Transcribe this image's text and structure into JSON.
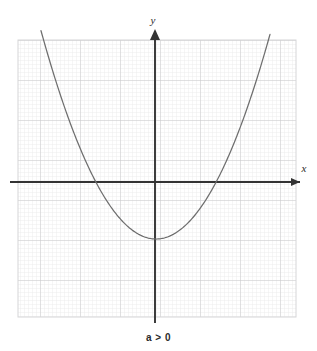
{
  "figure": {
    "caption": "a > 0",
    "background_color": "#ffffff"
  },
  "axes": {
    "x_label": "x",
    "y_label": "y",
    "axis_color": "#333333",
    "origin_px": {
      "x": 155,
      "y": 182
    }
  },
  "grid": {
    "minor_color": "#e9e9ea",
    "major_color": "#c9c9cc",
    "minor_spacing_px": 4,
    "major_spacing_px": 40,
    "region_px": {
      "left": 18,
      "top": 40,
      "right": 296,
      "bottom": 317
    }
  },
  "chart_data": {
    "type": "line",
    "title": "",
    "subtitle": "",
    "xlabel": "x",
    "ylabel": "y",
    "annotations": [
      "a > 0"
    ],
    "legend": [],
    "legend_position": "none",
    "grid": true,
    "xlim": [
      -3.425,
      3.525
    ],
    "ylim": [
      -3.375,
      3.55
    ],
    "series": [
      {
        "name": "parabola",
        "color": "#6e6e6e",
        "equation": "y = a(x - h)^2 + k, a > 0",
        "vertex": [
          0.025,
          -1.425
        ],
        "a": 0.63,
        "roots": [
          -2.075,
          2.125
        ],
        "x": [
          -2.85,
          -2.6,
          -2.35,
          -2.1,
          -1.85,
          -1.6,
          -1.35,
          -1.1,
          -0.85,
          -0.6,
          -0.35,
          -0.1,
          0.025,
          0.15,
          0.4,
          0.65,
          0.9,
          1.15,
          1.4,
          1.65,
          1.9,
          2.15,
          2.4,
          2.65,
          2.875
        ],
        "y": [
          3.1,
          2.27,
          1.51,
          0.83,
          0.23,
          -0.3,
          -0.75,
          -1.12,
          -1.41,
          -1.62,
          -1.76,
          -1.81,
          -1.425,
          -1.8,
          -1.72,
          -1.56,
          -1.32,
          -1.0,
          -0.6,
          -0.12,
          0.44,
          1.07,
          1.79,
          2.58,
          3.35
        ],
        "pixel_points": [
          [
            41,
            77
          ],
          [
            51,
            100
          ],
          [
            62,
            120
          ],
          [
            72,
            182
          ],
          [
            82,
            152
          ],
          [
            92,
            167
          ],
          [
            102,
            180
          ],
          [
            112,
            190
          ],
          [
            122,
            198
          ],
          [
            132,
            204
          ],
          [
            142,
            208
          ],
          [
            151,
            210
          ],
          [
            156,
            239
          ],
          [
            161,
            210
          ],
          [
            171,
            208
          ],
          [
            181,
            204
          ],
          [
            191,
            198
          ],
          [
            201,
            190
          ],
          [
            211,
            180
          ],
          [
            221,
            167
          ],
          [
            231,
            152
          ],
          [
            240,
            182
          ],
          [
            251,
            120
          ],
          [
            261,
            100
          ],
          [
            270,
            77
          ]
        ]
      }
    ]
  }
}
